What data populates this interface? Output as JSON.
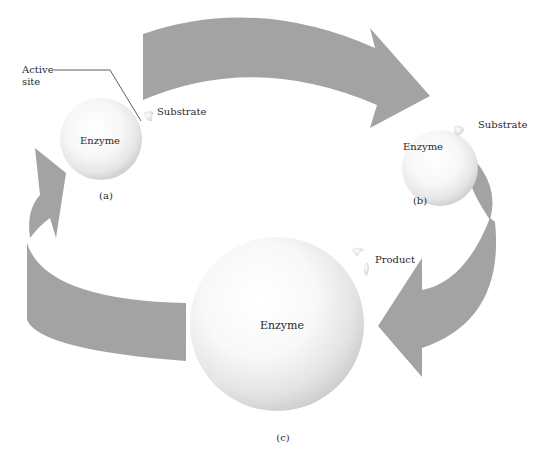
{
  "diagram": {
    "type": "enzyme-substrate catalytic cycle",
    "colors": {
      "arrow": "#a3a3a3",
      "sphere_light": "#ffffff",
      "sphere_shadow": "#d6d6d6",
      "text": "#2a2a2a",
      "leader_line": "#333333"
    },
    "stages": [
      {
        "id": "a",
        "caption": "(a)",
        "enzyme_label": "Enzyme",
        "substrate_label": "Substrate",
        "active_site_label_line1": "Active",
        "active_site_label_line2": "site"
      },
      {
        "id": "b",
        "caption": "(b)",
        "enzyme_label": "Enzyme",
        "substrate_label": "Substrate"
      },
      {
        "id": "c",
        "caption": "(c)",
        "enzyme_label": "Enzyme",
        "product_label": "Product"
      }
    ],
    "arrows": [
      {
        "from": "a",
        "to": "b",
        "direction": "clockwise",
        "icon": "curved-arrow-right"
      },
      {
        "from": "b",
        "to": "c",
        "direction": "clockwise",
        "icon": "curved-arrow-down-left"
      },
      {
        "from": "c",
        "to": "a",
        "direction": "clockwise",
        "icon": "curved-arrow-left-up"
      }
    ]
  }
}
